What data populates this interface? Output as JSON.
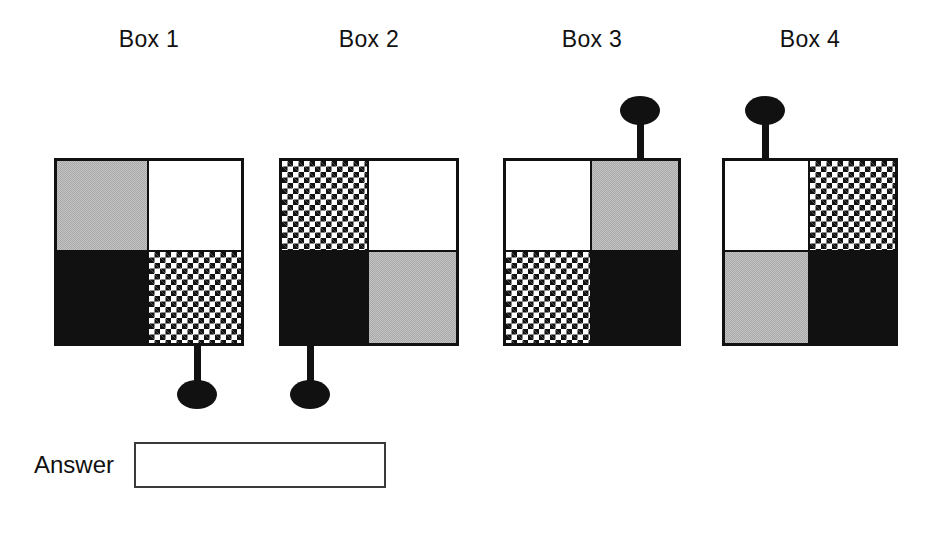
{
  "page": {
    "background_color": "#ffffff",
    "width": 940,
    "height": 535
  },
  "palette": {
    "black": "#111111",
    "white": "#ffffff",
    "gray": "#a9a9a9",
    "border": "#111111"
  },
  "boxes": [
    {
      "label": "Box 1",
      "quadrants": {
        "top_left": "gray",
        "top_right": "white",
        "bottom_left": "black",
        "bottom_right": "checker"
      },
      "pin": {
        "direction": "down",
        "attached_quadrant": "bottom_right",
        "stem_length": 26,
        "head_shape": "ellipse"
      }
    },
    {
      "label": "Box 2",
      "quadrants": {
        "top_left": "checker",
        "top_right": "white",
        "bottom_left": "black",
        "bottom_right": "gray"
      },
      "pin": {
        "direction": "down",
        "attached_quadrant": "bottom_left",
        "stem_length": 26,
        "head_shape": "ellipse"
      }
    },
    {
      "label": "Box 3",
      "quadrants": {
        "top_left": "white",
        "top_right": "gray",
        "bottom_left": "checker",
        "bottom_right": "black"
      },
      "pin": {
        "direction": "up",
        "attached_quadrant": "top_right",
        "stem_length": 42,
        "head_shape": "ellipse"
      }
    },
    {
      "label": "Box 4",
      "quadrants": {
        "top_left": "white",
        "top_right": "checker",
        "bottom_left": "gray",
        "bottom_right": "black"
      },
      "pin": {
        "direction": "up",
        "attached_quadrant": "top_left",
        "stem_length": 42,
        "head_shape": "ellipse"
      }
    }
  ],
  "answer": {
    "label": "Answer",
    "value": "",
    "placeholder": ""
  }
}
